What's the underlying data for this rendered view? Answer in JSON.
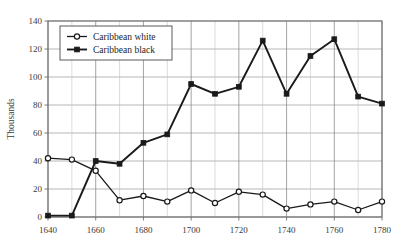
{
  "chart_data": {
    "type": "line",
    "title": "",
    "subtitle": "",
    "xlabel": "",
    "ylabel": "Thousands",
    "xlim": [
      1640,
      1780
    ],
    "ylim": [
      0,
      140
    ],
    "ytick_step": 20,
    "xtick_step": 20,
    "grid": true,
    "legend_position": "top-left",
    "x": [
      1640,
      1650,
      1660,
      1670,
      1680,
      1690,
      1700,
      1710,
      1720,
      1730,
      1740,
      1750,
      1760,
      1770,
      1780
    ],
    "xticks": [
      "1640",
      "1660",
      "1680",
      "1700",
      "1720",
      "1740",
      "1760",
      "1780"
    ],
    "yticks": [
      "0",
      "20",
      "40",
      "60",
      "80",
      "100",
      "120",
      "140"
    ],
    "series": [
      {
        "name": "Caribbean white",
        "marker": "open-circle",
        "color": "#1a1a1a",
        "values": [
          42,
          41,
          33,
          12,
          15,
          11,
          19,
          10,
          18,
          16,
          6,
          9,
          11,
          5,
          11
        ]
      },
      {
        "name": "Caribbean black",
        "marker": "filled-square",
        "color": "#1a1a1a",
        "values": [
          1,
          1,
          40,
          38,
          53,
          59,
          95,
          88,
          93,
          126,
          88,
          115,
          127,
          86,
          81
        ]
      }
    ]
  },
  "legend": {
    "entries": [
      {
        "label": "Caribbean white"
      },
      {
        "label": "Caribbean black"
      }
    ]
  },
  "axes": {
    "y_title": "Thousands"
  }
}
